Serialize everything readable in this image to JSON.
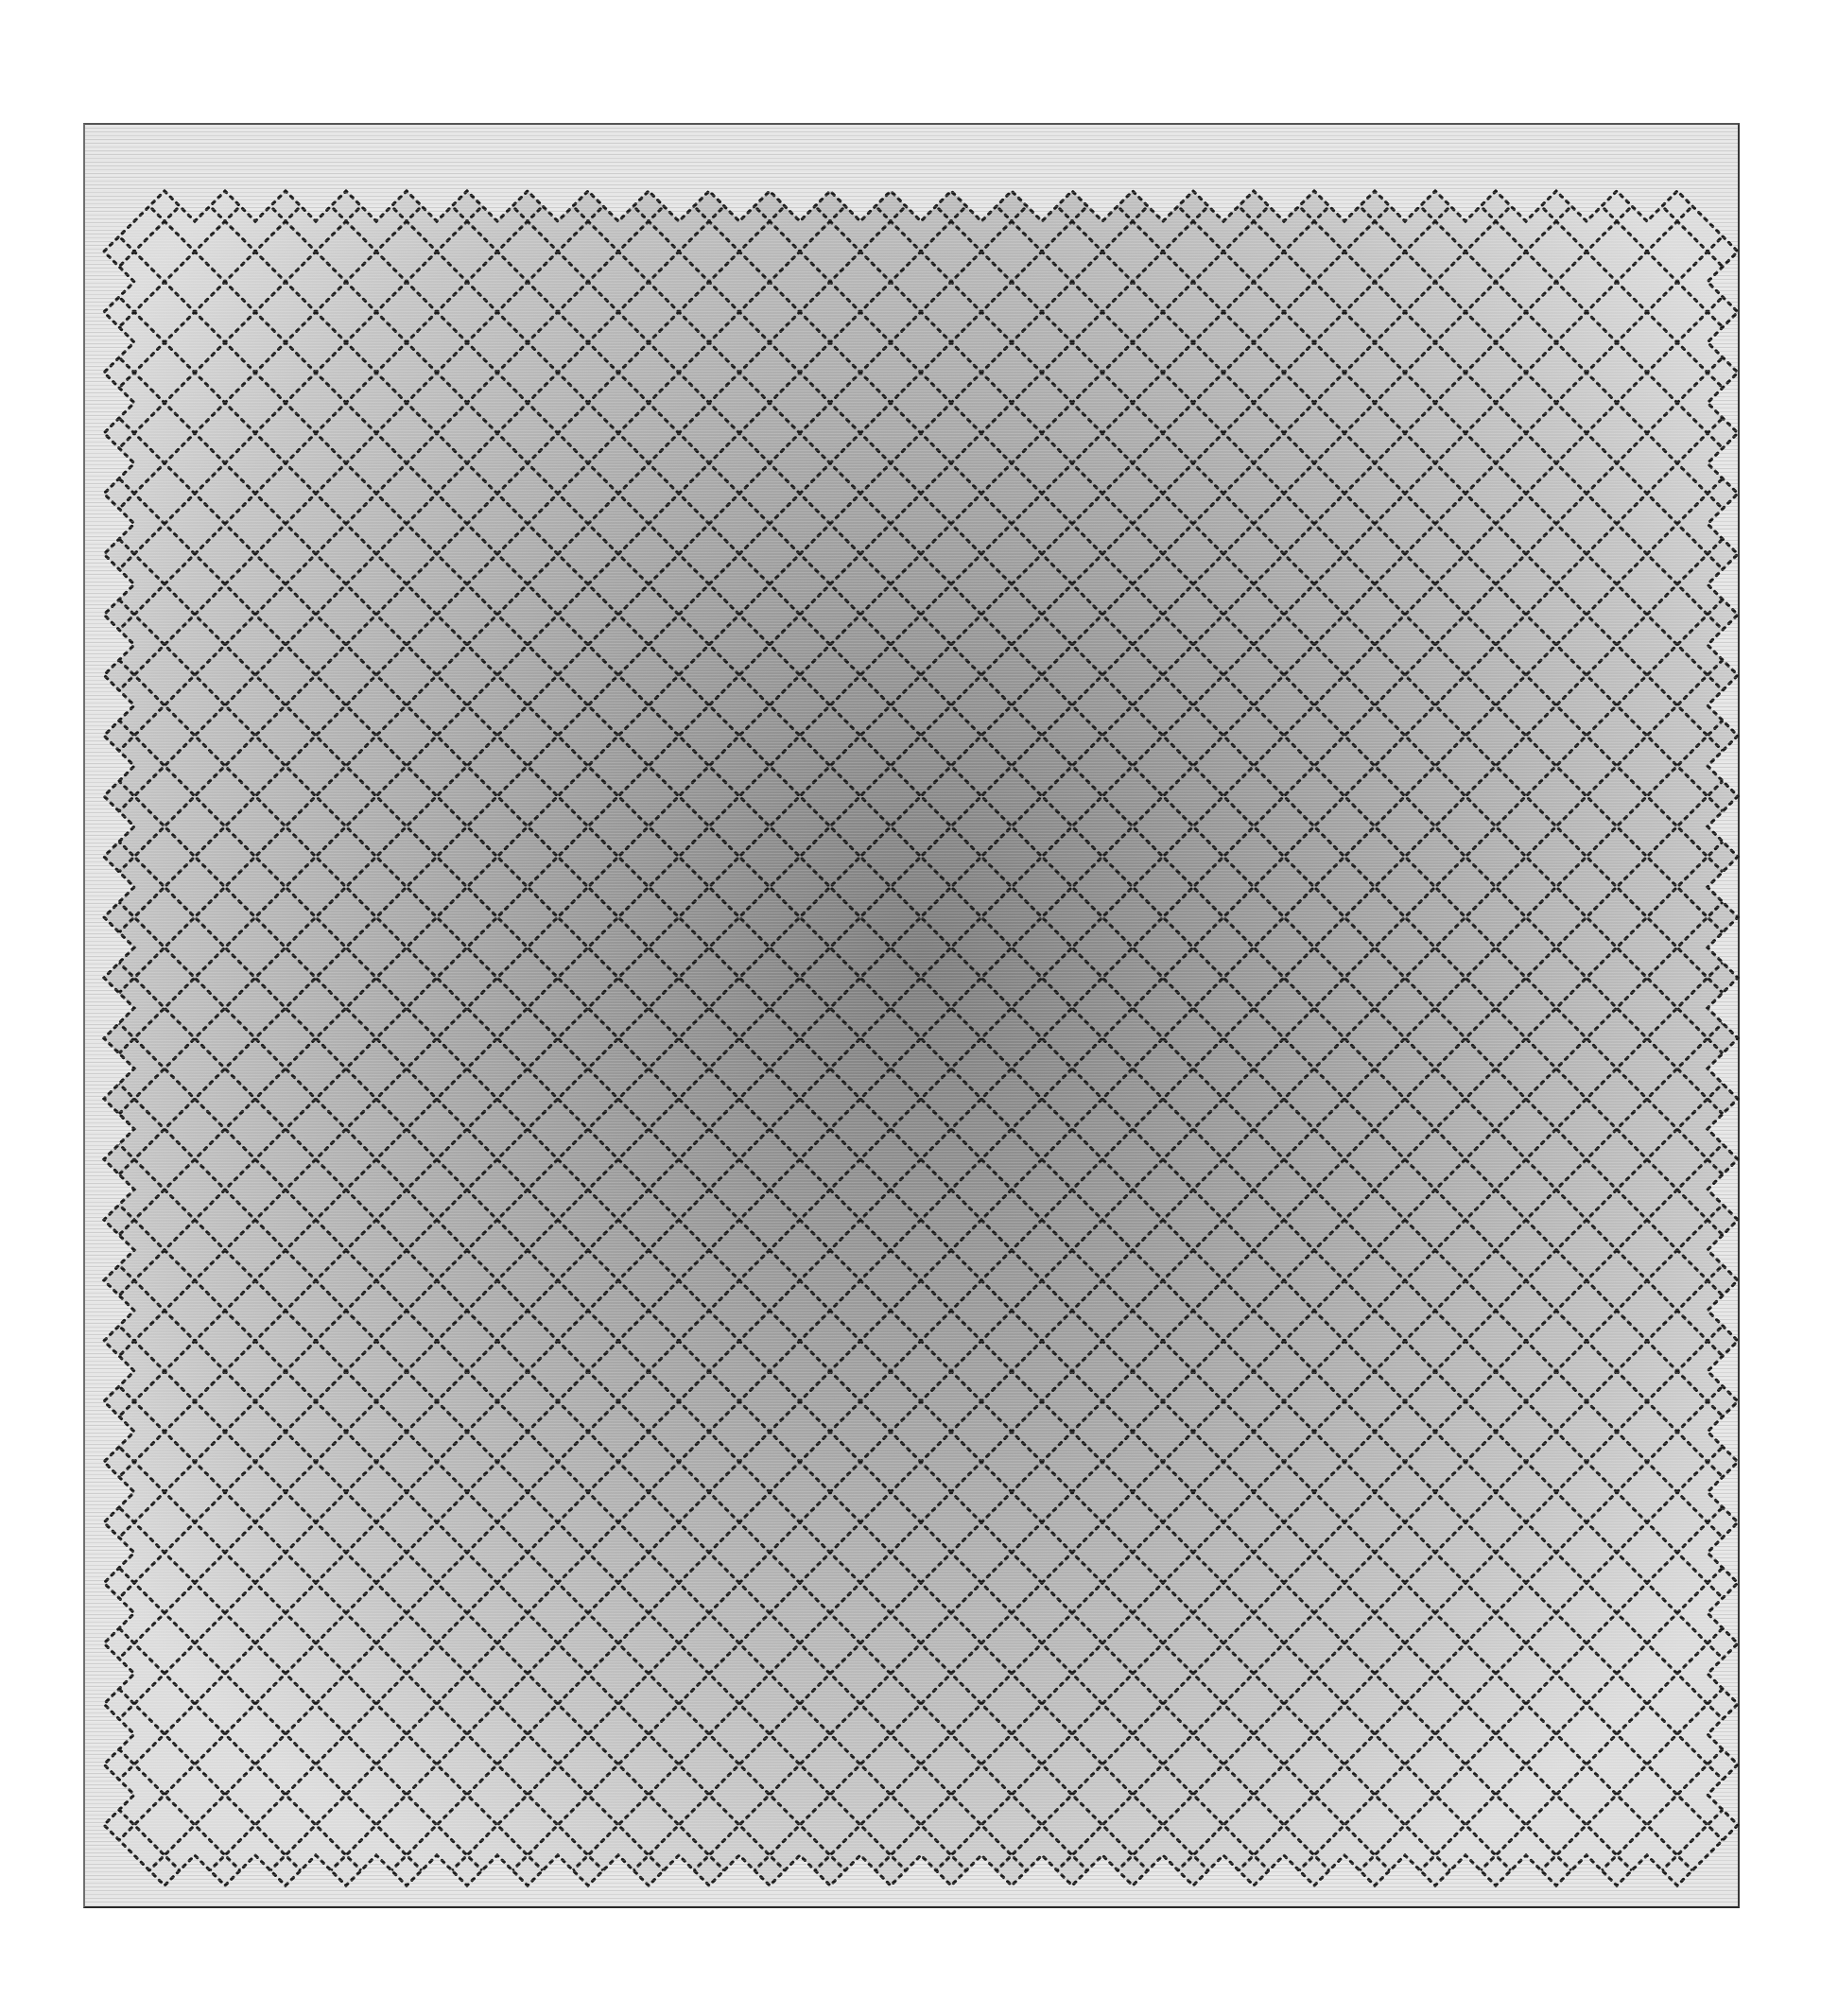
{
  "canvas": {
    "width": 1944,
    "height": 2132,
    "background": "#ffffff"
  },
  "rug": {
    "x": 88,
    "y": 130,
    "width": 1752,
    "height": 1888,
    "border_color": "#e6e6e6",
    "edge_color": "#555555"
  },
  "field": {
    "x": 140,
    "y": 200,
    "width": 1660,
    "height": 1740,
    "diamond_pitch": 64,
    "lattice_line_color": "#1a1a1a",
    "center_shade": "#7c7c7c",
    "mid_shade": "#a4a4a4",
    "corner_shade": "#dcdcdc"
  },
  "colors": {
    "background": "#ffffff",
    "border_light": "#e6e6e6",
    "field_dark": "#7c7c7c",
    "field_light": "#dcdcdc",
    "lattice_dots": "#1a1a1a"
  }
}
